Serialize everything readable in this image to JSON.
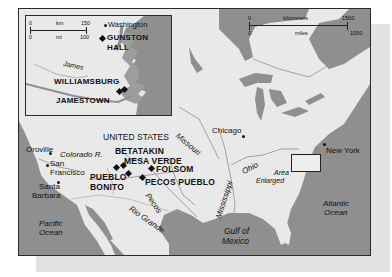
{
  "map": {
    "title_region": "UNITED STATES",
    "scale_main": {
      "km_label": "kilometers",
      "km_ticks": [
        "0",
        "1500"
      ],
      "mi_label": "miles",
      "mi_ticks": [
        "0",
        "1000"
      ]
    },
    "scale_inset": {
      "km_label": "km",
      "km_ticks": [
        "0",
        "150"
      ],
      "mi_label": "mi",
      "mi_ticks": [
        "0",
        "100"
      ]
    },
    "sites": [
      "BETATAKIN",
      "MESA VERDE",
      "FOLSOM",
      "PUEBLO BONITO",
      "PECOS PUEBLO"
    ],
    "site_labels": {
      "betatakin": "BETATAKIN",
      "mesa_verde": "MESA VERDE",
      "folsom": "FOLSOM",
      "pueblo": "PUEBLO",
      "bonito": "BONITO",
      "pecos_pueblo": "PECOS PUEBLO"
    },
    "cities": {
      "oroville": "Oroville",
      "san": "San",
      "francisco": "Francisco",
      "santa": "Santa",
      "barbara": "Barbara",
      "chicago": "Chicago",
      "new_york": "New York"
    },
    "rivers": {
      "colorado": "Colorado R.",
      "missouri": "Missouri",
      "mississippi": "Mississippi",
      "ohio": "Ohio",
      "pecos": "Pecos",
      "rio_grande": "Rio Grande"
    },
    "water": {
      "pacific_1": "Pacific",
      "pacific_2": "Ocean",
      "atlantic_1": "Atlantic",
      "atlantic_2": "Ocean",
      "gulf_1": "Gulf of",
      "gulf_2": "Mexico"
    },
    "area_enlarged": {
      "line1": "Area",
      "line2": "Enlarged"
    },
    "inset": {
      "washington": "Washington",
      "gunston_1": "GUNSTON",
      "gunston_2": "HALL",
      "james": "James",
      "williamsburg": "WILLIAMSBURG",
      "jamestown": "JAMESTOWN"
    },
    "colors": {
      "land": "#e9e9e9",
      "water": "#8f8f8f",
      "border": "#2a2a2a",
      "shadow": "#e2e2e2"
    }
  }
}
